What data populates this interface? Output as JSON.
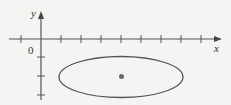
{
  "diagram": {
    "axes": {
      "x_label": "x",
      "y_label": "y",
      "origin_label": "0"
    },
    "ellipse": {
      "center": [
        121,
        77
      ],
      "rx": 62,
      "ry": 20.5
    },
    "colors": {
      "background": "#f4f4f2",
      "stroke": "#555555",
      "dot": "#666666"
    }
  }
}
